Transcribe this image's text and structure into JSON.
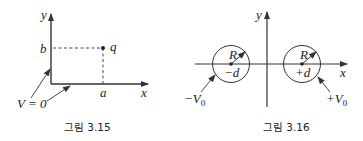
{
  "figures": [
    {
      "id": "fig-3-15",
      "caption": "그림 3.15",
      "axes": {
        "x_label": "x",
        "y_label": "y"
      },
      "point": {
        "label": "q",
        "x_label": "a",
        "y_label": "b"
      },
      "boundary_label": "V = 0"
    },
    {
      "id": "fig-3-16",
      "caption": "그림 3.16",
      "axes": {
        "x_label": "x",
        "y_label": "y"
      },
      "left_cylinder": {
        "radius_label": "R",
        "center_label": "−d",
        "potential_label": "−V",
        "potential_sub": "0"
      },
      "right_cylinder": {
        "radius_label": "R",
        "center_label": "+d",
        "potential_label": "+V",
        "potential_sub": "0"
      }
    }
  ],
  "colors": {
    "line": "#333333",
    "background": "#ffffff"
  }
}
